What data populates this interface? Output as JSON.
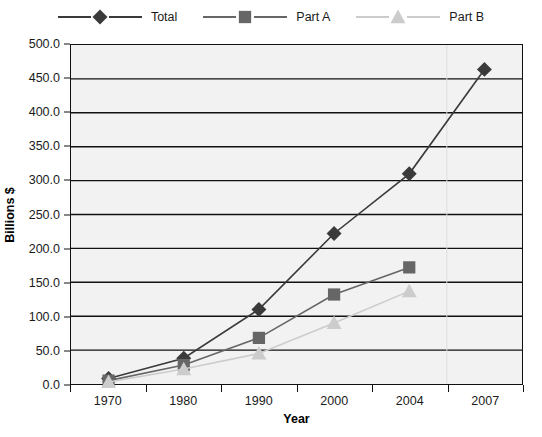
{
  "chart_data": {
    "type": "line",
    "title": "",
    "xlabel": "Year",
    "ylabel": "Billions $",
    "categories": [
      "1970",
      "1980",
      "1990",
      "2000",
      "2004",
      "2007"
    ],
    "ylim": [
      0,
      500
    ],
    "ytick_step": 50,
    "ytick_labels": [
      "0.0",
      "50.0",
      "100.0",
      "150.0",
      "200.0",
      "250.0",
      "300.0",
      "350.0",
      "400.0",
      "450.0",
      "500.0"
    ],
    "ytick_values": [
      0,
      50,
      100,
      150,
      200,
      250,
      300,
      350,
      400,
      450,
      500
    ],
    "grid": "horizontal",
    "legend_position": "top",
    "plot_background": "#f2f2f2",
    "series": [
      {
        "name": "Total",
        "marker": "diamond",
        "color": "#3a3a3a",
        "values": [
          8,
          38,
          110,
          222,
          310,
          464
        ]
      },
      {
        "name": "Part A",
        "marker": "square",
        "color": "#666666",
        "values": [
          5,
          28,
          68,
          132,
          172,
          null
        ]
      },
      {
        "name": "Part B",
        "marker": "triangle",
        "color": "#cccccc",
        "values": [
          3,
          22,
          45,
          90,
          137,
          null
        ]
      }
    ]
  }
}
